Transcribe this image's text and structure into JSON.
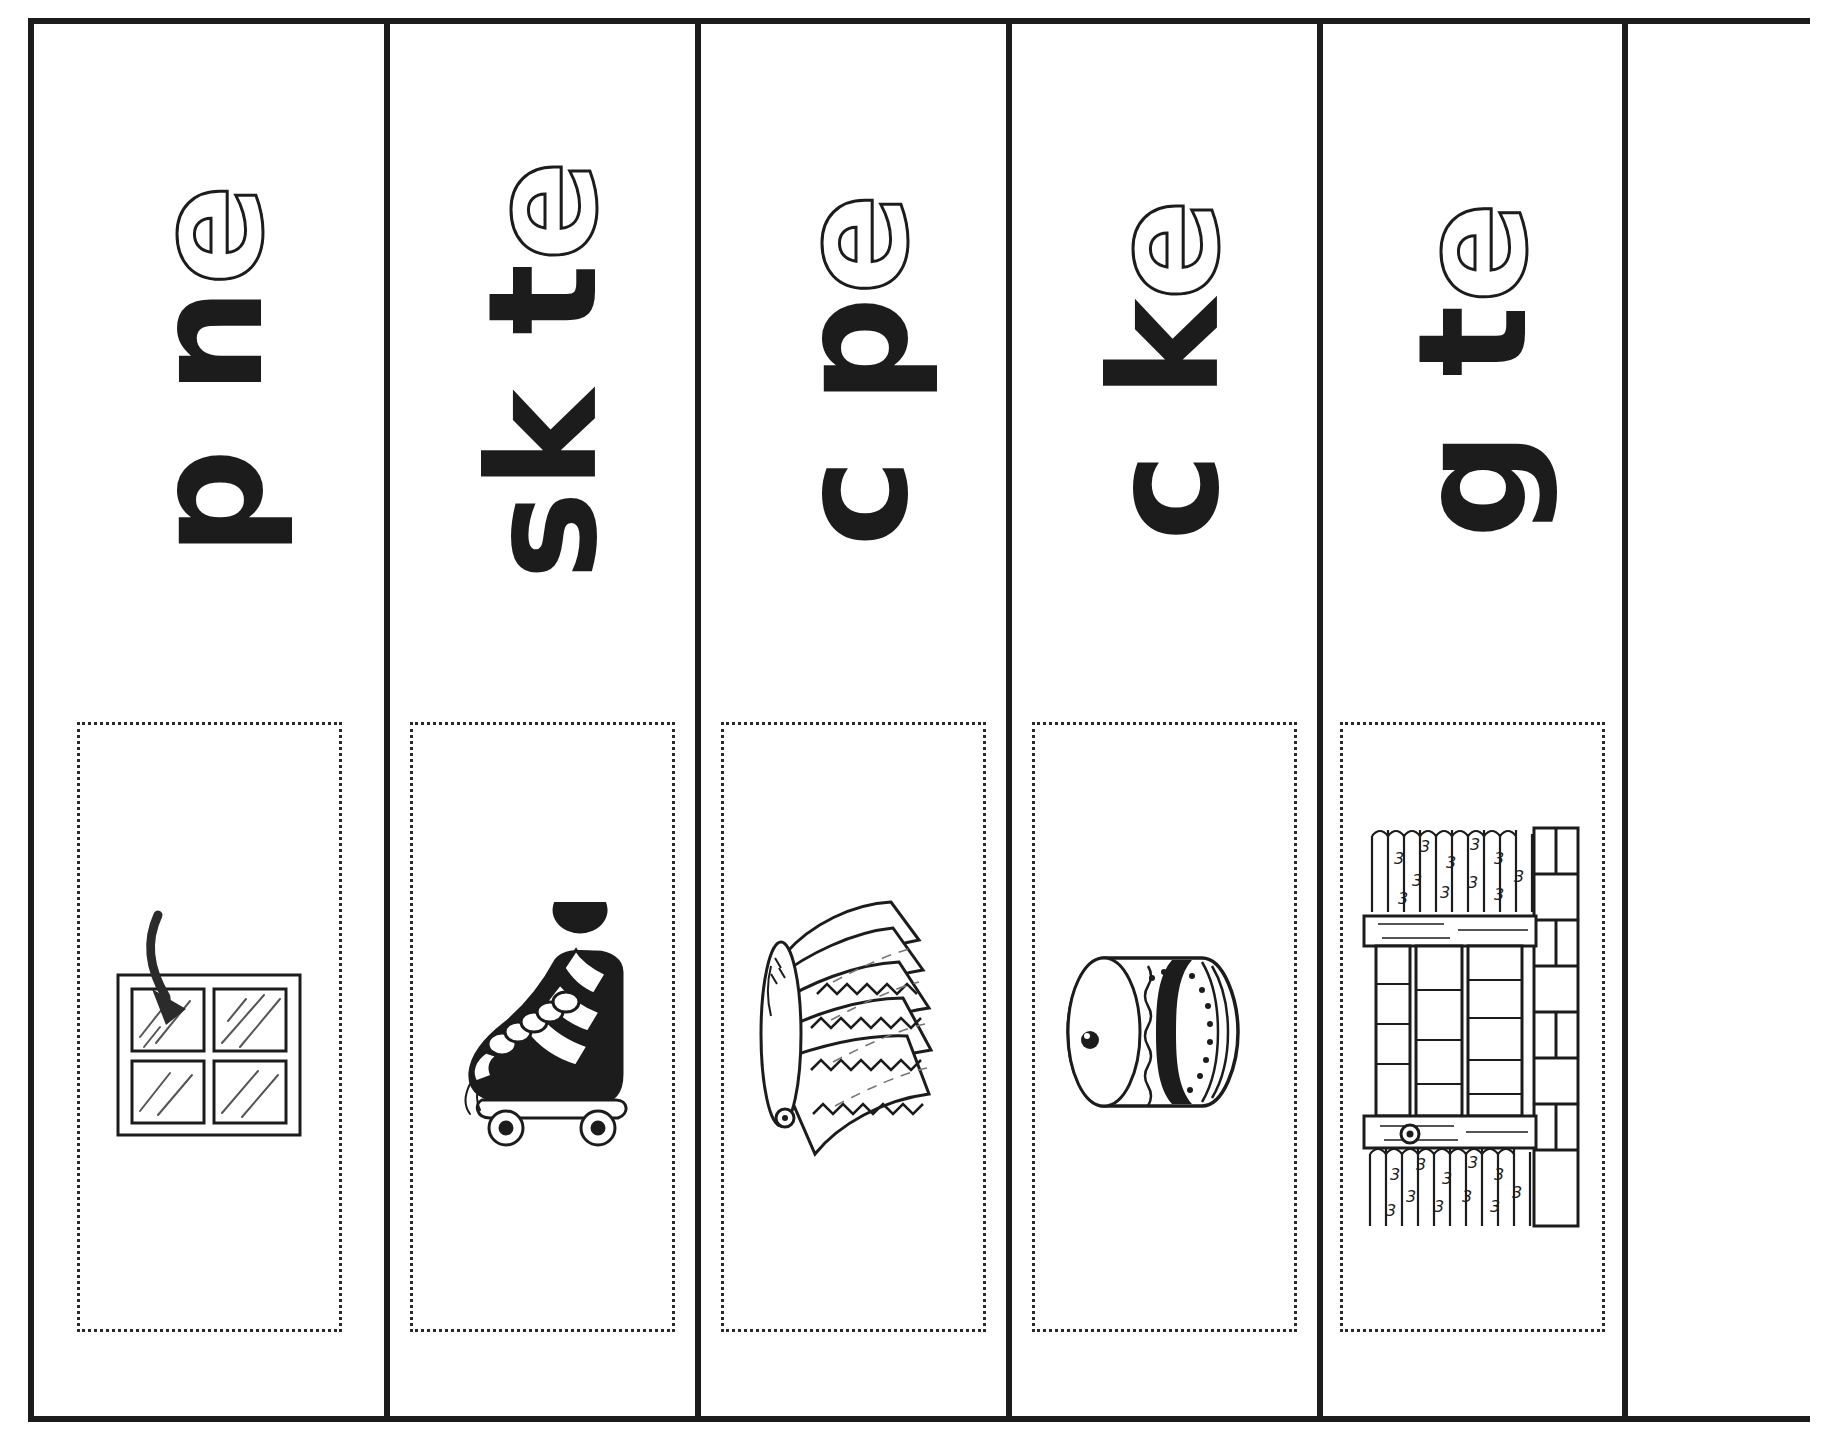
{
  "worksheet": {
    "title": "Silent e word strips",
    "layout": "five vertical cut-apart strips, letters rotated 90 degrees counter-clockwise",
    "ink_color": "#1c1c1c",
    "paper_color": "#ffffff",
    "border_style": "heavy black rules between strips; dotted rectangle around each picture"
  },
  "strips": [
    {
      "id": "strip-pane",
      "word": "pane",
      "onset": "p",
      "middle": "n",
      "silent_e": "e",
      "letters_display": "p  n e",
      "picture": {
        "name": "window-pane-picture",
        "label": "pane",
        "description": "four-pane window with an arrow pointing at the upper-left pane"
      }
    },
    {
      "id": "strip-skate",
      "word": "skate",
      "onset": "sk",
      "middle": "t",
      "silent_e": "e",
      "letters_display": "sk  t e",
      "picture": {
        "name": "roller-skate-picture",
        "label": "skate",
        "description": "high-top roller skate with laces and four wheels"
      }
    },
    {
      "id": "strip-cape",
      "word": "cape",
      "onset": "c",
      "middle": "p",
      "silent_e": "e",
      "letters_display": "c  p e",
      "picture": {
        "name": "cape-picture",
        "label": "cape",
        "description": "fan-shaped cape with zig-zag trim and a round clasp"
      }
    },
    {
      "id": "strip-cake",
      "word": "cake",
      "onset": "c",
      "middle": "k",
      "silent_e": "e",
      "letters_display": "c  k e",
      "picture": {
        "name": "cake-picture",
        "label": "cake",
        "description": "round layer cake seen from the side with frosting band"
      }
    },
    {
      "id": "strip-gate",
      "word": "gate",
      "onset": "g",
      "middle": "t",
      "silent_e": "e",
      "letters_display": "g  t e",
      "picture": {
        "name": "gate-picture",
        "label": "gate",
        "description": "wooden rail gate between stone posts with bushes behind"
      }
    }
  ]
}
